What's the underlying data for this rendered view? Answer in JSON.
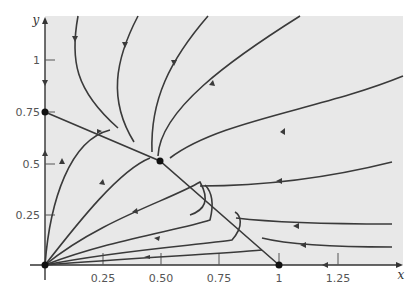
{
  "figure": {
    "type": "phase-portrait",
    "background_color": "#e8e8e8",
    "curve_color": "#3a3a3a",
    "x_axis": {
      "name": "x",
      "ticks": [
        "0.25",
        "0.50",
        "0.75",
        "1",
        "1.25"
      ]
    },
    "y_axis": {
      "name": "y",
      "ticks": [
        "0.25",
        "0.5",
        "0.75",
        "1"
      ]
    },
    "critical_points": [
      {
        "label": "origin",
        "x": 0,
        "y": 0
      },
      {
        "label": "y-intercept",
        "x": 0,
        "y": 0.75
      },
      {
        "label": "interior-saddle",
        "x": 0.5,
        "y": 0.5
      },
      {
        "label": "x-intercept",
        "x": 1,
        "y": 0
      }
    ]
  }
}
